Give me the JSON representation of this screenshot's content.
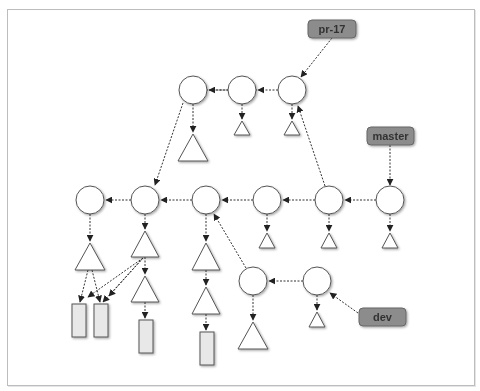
{
  "diagram": {
    "refs": [
      {
        "id": "pr17",
        "label": "pr-17",
        "x": 308,
        "y": 20,
        "w": 48,
        "h": 18
      },
      {
        "id": "master",
        "label": "master",
        "x": 367,
        "y": 127,
        "w": 47,
        "h": 18
      },
      {
        "id": "dev",
        "label": "dev",
        "x": 359,
        "y": 308,
        "w": 47,
        "h": 18
      }
    ],
    "colors": {
      "ref_fill": "#8c8c8c",
      "ref_stroke": "#666666",
      "node_stroke": "#555555",
      "blob_fill": "#e8e8e8",
      "frame": "#bdbdbd",
      "arrow": "#222222"
    },
    "commits": [
      {
        "id": "t1",
        "cx": 193,
        "cy": 90
      },
      {
        "id": "t2",
        "cx": 242,
        "cy": 90
      },
      {
        "id": "t3",
        "cx": 292,
        "cy": 90
      },
      {
        "id": "m1",
        "cx": 90,
        "cy": 200
      },
      {
        "id": "m2",
        "cx": 145,
        "cy": 200
      },
      {
        "id": "m3",
        "cx": 206,
        "cy": 200
      },
      {
        "id": "m4",
        "cx": 267,
        "cy": 200
      },
      {
        "id": "m5",
        "cx": 329,
        "cy": 200
      },
      {
        "id": "m6",
        "cx": 390,
        "cy": 200
      },
      {
        "id": "d1",
        "cx": 253,
        "cy": 281
      },
      {
        "id": "d2",
        "cx": 317,
        "cy": 281
      }
    ],
    "trees": [
      {
        "id": "tt1",
        "cx": 192,
        "top": 134,
        "size": "large"
      },
      {
        "id": "tt2",
        "cx": 242,
        "top": 121,
        "size": "small"
      },
      {
        "id": "tt3",
        "cx": 292,
        "top": 121,
        "size": "small"
      },
      {
        "id": "mt1",
        "cx": 90,
        "top": 243,
        "size": "large"
      },
      {
        "id": "mt2",
        "cx": 145,
        "top": 231,
        "size": "large"
      },
      {
        "id": "mt2b",
        "cx": 145,
        "top": 276,
        "size": "large"
      },
      {
        "id": "mt3",
        "cx": 206,
        "top": 243,
        "size": "large"
      },
      {
        "id": "mt3b",
        "cx": 206,
        "top": 287,
        "size": "large"
      },
      {
        "id": "mt4",
        "cx": 267,
        "top": 233,
        "size": "small"
      },
      {
        "id": "mt5",
        "cx": 329,
        "top": 233,
        "size": "small"
      },
      {
        "id": "mt6",
        "cx": 390,
        "top": 233,
        "size": "small"
      },
      {
        "id": "dt1",
        "cx": 253,
        "top": 322,
        "size": "large"
      },
      {
        "id": "dt2",
        "cx": 317,
        "top": 312,
        "size": "small"
      }
    ],
    "blobs": [
      {
        "id": "b1",
        "x": 72,
        "y": 304,
        "w": 14,
        "h": 33
      },
      {
        "id": "b2",
        "x": 94,
        "y": 304,
        "w": 14,
        "h": 33
      },
      {
        "id": "b3",
        "x": 139,
        "y": 320,
        "w": 14,
        "h": 33
      },
      {
        "id": "b4",
        "x": 200,
        "y": 332,
        "w": 14,
        "h": 33
      }
    ]
  }
}
